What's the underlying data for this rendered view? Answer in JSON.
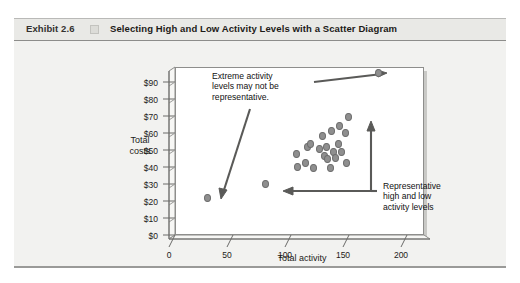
{
  "exhibit": {
    "number": "Exhibit 2.6",
    "title": "Selecting High and Low Activity Levels with a Scatter Diagram"
  },
  "chart_data": {
    "type": "scatter",
    "title": "Selecting High and Low Activity Levels with a Scatter Diagram",
    "xlabel": "Total activity",
    "ylabel": "Total\ncosts",
    "ylabel_line1": "Total",
    "ylabel_line2": "costs",
    "xlim": [
      0,
      215
    ],
    "ylim": [
      0,
      95
    ],
    "grid": false,
    "legend": "none",
    "xticks": [
      0,
      50,
      100,
      150,
      200
    ],
    "xtick_labels": [
      "0",
      "50",
      "100",
      "150",
      "200"
    ],
    "yticks": [
      0,
      10,
      20,
      30,
      40,
      50,
      60,
      70,
      80,
      90
    ],
    "ytick_labels": [
      "$0",
      "$10",
      "$20",
      "$30",
      "$40",
      "$50",
      "$60",
      "$70",
      "$80",
      "$90"
    ],
    "points": [
      {
        "x": 28,
        "y": 21,
        "role": "extreme-low"
      },
      {
        "x": 176,
        "y": 92,
        "role": "extreme-high"
      },
      {
        "x": 78,
        "y": 29,
        "role": "representative-low"
      },
      {
        "x": 150,
        "y": 67,
        "role": "representative-high"
      },
      {
        "x": 105,
        "y": 46,
        "role": "cluster"
      },
      {
        "x": 106,
        "y": 39,
        "role": "cluster"
      },
      {
        "x": 113,
        "y": 41,
        "role": "cluster"
      },
      {
        "x": 114,
        "y": 50,
        "role": "cluster"
      },
      {
        "x": 117,
        "y": 52,
        "role": "cluster"
      },
      {
        "x": 120,
        "y": 38,
        "role": "cluster"
      },
      {
        "x": 125,
        "y": 49,
        "role": "cluster"
      },
      {
        "x": 127,
        "y": 56,
        "role": "cluster"
      },
      {
        "x": 129,
        "y": 45,
        "role": "cluster"
      },
      {
        "x": 131,
        "y": 50,
        "role": "cluster"
      },
      {
        "x": 132,
        "y": 43,
        "role": "cluster"
      },
      {
        "x": 134,
        "y": 38,
        "role": "cluster"
      },
      {
        "x": 135,
        "y": 59,
        "role": "cluster"
      },
      {
        "x": 137,
        "y": 47,
        "role": "cluster"
      },
      {
        "x": 139,
        "y": 44,
        "role": "cluster"
      },
      {
        "x": 141,
        "y": 52,
        "role": "cluster"
      },
      {
        "x": 142,
        "y": 62,
        "role": "cluster"
      },
      {
        "x": 144,
        "y": 47,
        "role": "cluster"
      },
      {
        "x": 147,
        "y": 58,
        "role": "cluster"
      },
      {
        "x": 148,
        "y": 41,
        "role": "cluster"
      }
    ],
    "annotations": [
      {
        "id": "extreme",
        "text": "Extreme activity\nlevels may not be\nrepresentative.",
        "points_to": [
          "extreme-high",
          "extreme-low"
        ]
      },
      {
        "id": "representative",
        "text": "Representative\nhigh and low\nactivity levels",
        "points_to": [
          "representative-high",
          "representative-low"
        ]
      }
    ]
  },
  "colors": {
    "page_background": "#ffffff",
    "card_background": "#f2f2f0",
    "header_background": "#e9e9e6",
    "plot_background": "#ffffff",
    "dot_fill": "#8f8f8f",
    "dot_stroke": "#6d6d6d",
    "axis_line": "#6b6b69",
    "text": "#1c1a18",
    "arrow": "#5a5a58"
  }
}
